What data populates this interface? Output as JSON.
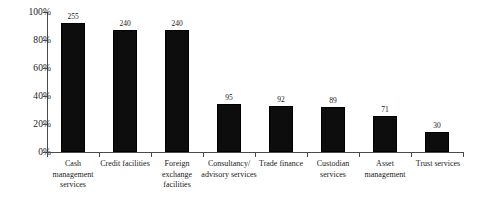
{
  "chart_data": {
    "type": "bar",
    "title": "",
    "subtitle": "",
    "xlabel": "",
    "ylabel": "",
    "ylim": [
      0,
      100
    ],
    "grid": false,
    "legend": "none",
    "bar_color": "#0d0d0d",
    "background_color": "#ffffff",
    "axis_color": "#4a4a4a",
    "categories": [
      "Cash management services",
      "Credit facilities",
      "Foreign exchange facilities",
      "Consultancy/ advisory services",
      "Trade finance",
      "Custodian services",
      "Asset management",
      "Trust services"
    ],
    "category_lines": [
      [
        "Cash",
        "management",
        "services"
      ],
      [
        "Credit facilities"
      ],
      [
        "Foreign",
        "exchange",
        "facilities"
      ],
      [
        "Consultancy/",
        "advisory services"
      ],
      [
        "Trade finance"
      ],
      [
        "Custodian",
        "services"
      ],
      [
        "Asset",
        "management"
      ],
      [
        "Trust services"
      ]
    ],
    "values": [
      255,
      240,
      240,
      95,
      92,
      89,
      71,
      30
    ],
    "data_labels": [
      "255",
      "240",
      "240",
      "95",
      "92",
      "89",
      "71",
      "30"
    ],
    "percent_heights": [
      92,
      87,
      87,
      34,
      33,
      32,
      26,
      14
    ],
    "yticks": [
      100,
      80,
      60,
      40,
      20,
      0
    ],
    "ytick_labels": [
      "100%",
      "80%",
      "60%",
      "40%",
      "20%",
      "0%"
    ]
  }
}
